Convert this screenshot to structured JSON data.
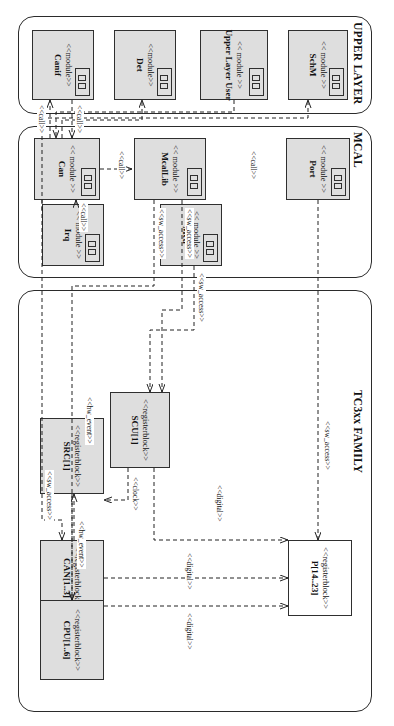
{
  "diagram": {
    "orientation": "rotated-90",
    "colors": {
      "node_fill": "#dedede",
      "node_plain": "#ffffff",
      "stroke": "#2f2f2f",
      "package_stroke": "#2b2b2b",
      "text": "#111111"
    }
  },
  "packages": [
    {
      "id": "upper",
      "label": "UPPER LAYER"
    },
    {
      "id": "mcal",
      "label": "MCAL"
    },
    {
      "id": "tc3xx",
      "label": "TC3xx FAMILY"
    }
  ],
  "nodes": [
    {
      "id": "canif",
      "stereotype": "<<module>>",
      "name": "Canif",
      "kind": "module",
      "fill": "gray",
      "package": "upper"
    },
    {
      "id": "det",
      "stereotype": "<<module>>",
      "name": "Det",
      "kind": "module",
      "fill": "gray",
      "package": "upper"
    },
    {
      "id": "upperusr",
      "stereotype": "<< module >>",
      "name": "Upper Layer User",
      "kind": "module",
      "fill": "gray",
      "package": "upper"
    },
    {
      "id": "schm",
      "stereotype": "<< module >>",
      "name": "SchM",
      "kind": "module",
      "fill": "gray",
      "package": "upper"
    },
    {
      "id": "can",
      "stereotype": "<< module >>",
      "name": "Can",
      "kind": "module",
      "fill": "gray",
      "package": "mcal"
    },
    {
      "id": "irq",
      "stereotype": "<< module >>",
      "name": "Irq",
      "kind": "module",
      "fill": "gray",
      "package": "mcal"
    },
    {
      "id": "mcallib",
      "stereotype": "<< module >>",
      "name": "McalLib",
      "kind": "module",
      "fill": "gray",
      "package": "mcal"
    },
    {
      "id": "mcu",
      "stereotype": "<< module >>",
      "name": "Mcu",
      "kind": "module",
      "fill": "gray",
      "package": "mcal"
    },
    {
      "id": "port",
      "stereotype": "<< module >>",
      "name": "Port",
      "kind": "module",
      "fill": "gray",
      "package": "mcal"
    },
    {
      "id": "cpu",
      "stereotype": "<<registerblock>>",
      "name": "CPU[1..6]",
      "kind": "registerblock",
      "fill": "gray",
      "package": "tc3xx"
    },
    {
      "id": "src",
      "stereotype": "<<registerblock>>",
      "name": "SRC[1]",
      "kind": "registerblock",
      "fill": "gray",
      "package": "tc3xx"
    },
    {
      "id": "can13",
      "stereotype": "<<registerblock>>",
      "name": "CAN[1..3]",
      "kind": "registerblock",
      "fill": "gray",
      "package": "tc3xx"
    },
    {
      "id": "scu",
      "stereotype": "<<registerblock>>",
      "name": "SCU[1]",
      "kind": "registerblock",
      "fill": "gray",
      "package": "tc3xx"
    },
    {
      "id": "p1423",
      "stereotype": "<<registerblock>>",
      "name": "P[14..23]",
      "kind": "registerblock",
      "fill": "white",
      "package": "tc3xx"
    }
  ],
  "edge_labels": [
    {
      "id": "l-call-canif-can",
      "text": "<<call>>"
    },
    {
      "id": "l-call-can-canif",
      "text": "<<call>>"
    },
    {
      "id": "l-call-can-mcallib",
      "text": "<<call>>"
    },
    {
      "id": "l-call-irq-can",
      "text": "<<call>>"
    },
    {
      "id": "l-call-port",
      "text": "<<call>>"
    },
    {
      "id": "l-swacc-mcallib-1",
      "text": "<<sw_access>>"
    },
    {
      "id": "l-swacc-mcallib-2",
      "text": "<<sw_access>>"
    },
    {
      "id": "l-swacc-mcu",
      "text": "<<sw_access>>"
    },
    {
      "id": "l-swacc-port",
      "text": "<<sw_access>>"
    },
    {
      "id": "l-swacc-can13",
      "text": "<<sw_access>>"
    },
    {
      "id": "l-hwevent-cpu",
      "text": "<<hw_event>>"
    },
    {
      "id": "l-hwevent-src",
      "text": "<<hw_event>>"
    },
    {
      "id": "l-clock",
      "text": "<<clock>>"
    },
    {
      "id": "l-digital-1",
      "text": "<<digital>>"
    },
    {
      "id": "l-digital-2",
      "text": "<<digital>>"
    },
    {
      "id": "l-digital-3",
      "text": "<<digital>>"
    }
  ]
}
